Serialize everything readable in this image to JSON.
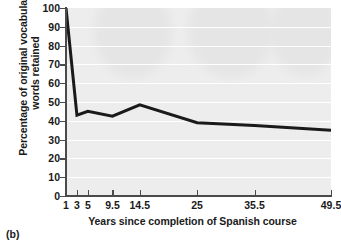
{
  "figure": {
    "caption": "(b)"
  },
  "chart_data": {
    "type": "line",
    "title": "",
    "xlabel": "Years since completion of Spanish course",
    "ylabel_line1": "Percentage of original vocabulary",
    "ylabel_line2": "words retained",
    "categories": [
      "1",
      "3",
      "5",
      "9.5",
      "14.5",
      "25",
      "35.5",
      "49.5"
    ],
    "x": [
      1,
      3,
      5,
      9.5,
      14.5,
      25,
      35.5,
      49.5
    ],
    "values": [
      100,
      43,
      45,
      42.5,
      48.5,
      39,
      37.5,
      35
    ],
    "xlim": [
      1,
      49.5
    ],
    "ylim": [
      0,
      100
    ],
    "ytick_labels": [
      "100",
      "90",
      "80",
      "70",
      "60",
      "50",
      "40",
      "30",
      "20",
      "10",
      "0"
    ],
    "ytick_values": [
      100,
      90,
      80,
      70,
      60,
      50,
      40,
      30,
      20,
      10,
      0
    ],
    "grid": "horizontal",
    "legend": "none",
    "line_color": "#1a1a1a",
    "plot_background": "#ededed",
    "gridline_color": "#ffffff"
  }
}
